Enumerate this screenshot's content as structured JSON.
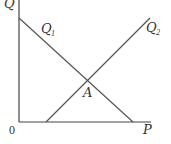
{
  "diagram": {
    "type": "supply-demand-style crossing lines",
    "axes": {
      "y_label": "Q",
      "x_label": "P",
      "origin_label": "0"
    },
    "lines": [
      {
        "name": "Q",
        "subscript": "1",
        "direction": "downward-sloping"
      },
      {
        "name": "Q",
        "subscript": "2",
        "direction": "upward-sloping"
      }
    ],
    "intersection_label": "A",
    "colors": {
      "axis": "#444444",
      "line": "#555555",
      "text": "#333333"
    }
  }
}
